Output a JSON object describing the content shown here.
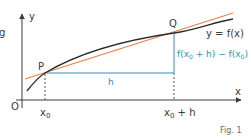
{
  "diagram": {
    "axes": {
      "x_label": "x",
      "y_label": "y",
      "origin_label": "O"
    },
    "points": {
      "P": "P",
      "Q": "Q"
    },
    "curve_label": "y = f(x)",
    "tick_labels": {
      "x0": "x",
      "x0_sub": "0",
      "x0h": "x",
      "x0h_sub": "0",
      "x0h_suffix": " + h"
    },
    "h_label": "h",
    "diff_label": {
      "part1": "f(x",
      "sub1": "0",
      "part2": " + h) − f(x",
      "sub2": "0",
      "part3": ")"
    },
    "caption": "Fig. 1",
    "edge_fragment": "g",
    "colors": {
      "curve": "#2b2b2b",
      "secant": "#e8804a",
      "increment": "#2f8fc4",
      "axis": "#3a3a3a"
    }
  }
}
